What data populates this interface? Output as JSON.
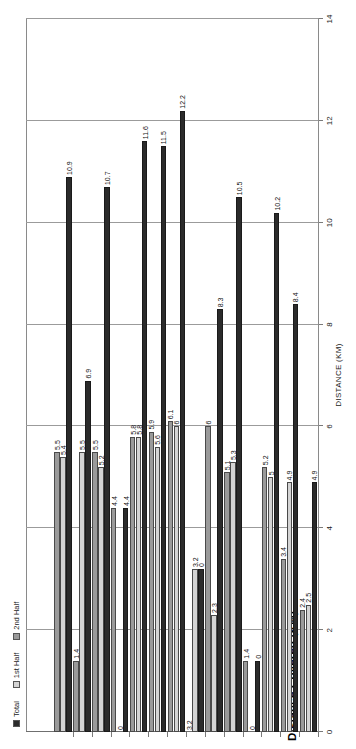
{
  "chart": {
    "title": "Distance Covered (KM)",
    "axis_title": "DISTANCE (KM)",
    "legend": [
      {
        "label": "Total",
        "color": "#2b2b2b"
      },
      {
        "label": "1st Half",
        "color": "#d4d4d4"
      },
      {
        "label": "2nd Half",
        "color": "#9a9a9a"
      }
    ]
  },
  "chart_data": {
    "type": "bar",
    "orientation": "horizontal",
    "title": "Distance Covered (KM)",
    "xlabel": "DISTANCE (KM)",
    "ylabel": "",
    "xlim": [
      0,
      14
    ],
    "xticks": [
      0,
      2,
      4,
      6,
      8,
      10,
      12,
      14
    ],
    "grid": true,
    "legend_position": "top-left",
    "categories": [
      "1",
      "2",
      "3",
      "4",
      "5",
      "6",
      "7",
      "8",
      "9",
      "10",
      "11",
      "12",
      "13",
      "14"
    ],
    "series": [
      {
        "name": "Total",
        "color": "#2b2b2b",
        "values": [
          10.9,
          6.9,
          10.7,
          4.4,
          11.6,
          11.5,
          12.2,
          3.2,
          8.3,
          10.5,
          1.4,
          10.2,
          8.4,
          4.9
        ]
      },
      {
        "name": "1st Half",
        "color": "#d4d4d4",
        "values": [
          5.4,
          5.5,
          5.2,
          0,
          5.8,
          5.6,
          6,
          3.2,
          2.3,
          5.3,
          0,
          5,
          4.9,
          2.5
        ]
      },
      {
        "name": "2nd Half",
        "color": "#9a9a9a",
        "values": [
          5.5,
          1.4,
          5.5,
          4.4,
          5.8,
          5.9,
          6.1,
          0,
          6,
          5.1,
          1.4,
          5.2,
          3.4,
          2.4
        ]
      }
    ],
    "labels": {
      "Total": [
        "10.9",
        "6.9",
        "10.7",
        "4.4",
        "11.6",
        "11.5",
        "12.2",
        "0",
        "8.3",
        "10.5",
        "0",
        "10.2",
        "8.4",
        "4.9"
      ],
      "1st Half": [
        "5.4",
        "5.5",
        "5.2",
        "0",
        "5.8",
        "5.6",
        "6",
        "3.2",
        "2.3",
        "5.3",
        "0",
        "5",
        "4.9",
        "2.5"
      ],
      "2nd Half": [
        "5.5",
        "1.4",
        "5.5",
        "4.4",
        "5.8",
        "5.9",
        "6.1",
        "3.2",
        "6",
        "5.1",
        "1.4",
        "5.2",
        "3.4",
        "2.4"
      ]
    }
  }
}
